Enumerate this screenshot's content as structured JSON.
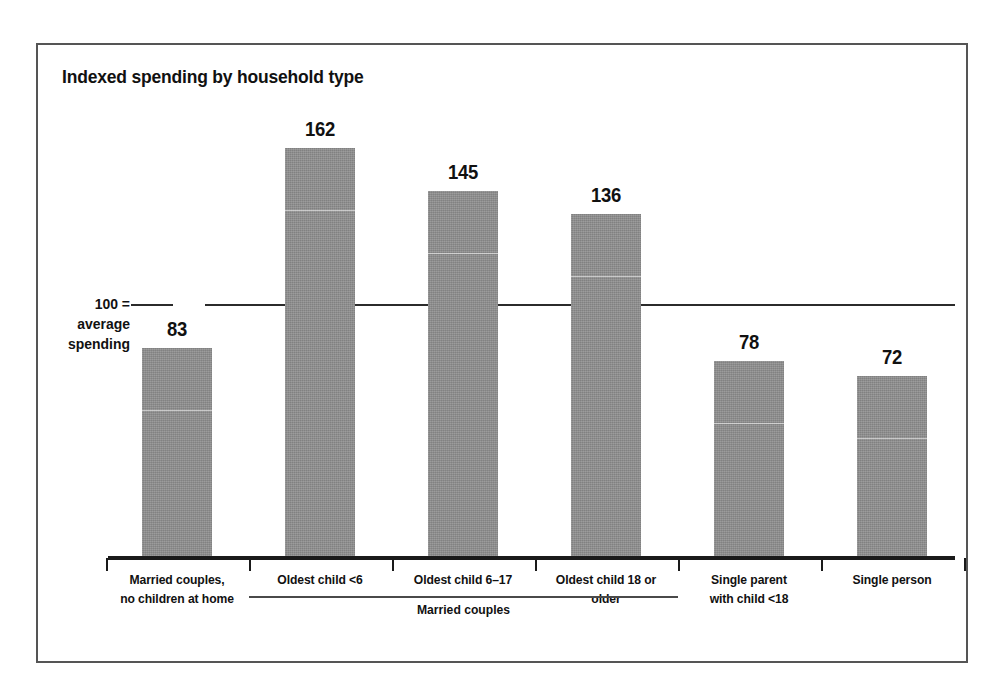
{
  "chart_data": {
    "type": "bar",
    "title": "Indexed spending by household type",
    "xlabel": "",
    "ylabel": "",
    "ylim": [
      0,
      170
    ],
    "grid": false,
    "legend": "none",
    "reference_line": {
      "value": 100,
      "label_lines": [
        "100 =",
        "average",
        "spending"
      ]
    },
    "categories": [
      "Married couples, no children at home",
      "Oldest child <6",
      "Oldest child 6–17",
      "Oldest child 18 or older",
      "Single parent with child <18",
      "Single person"
    ],
    "category_label_lines": [
      [
        "Married couples,",
        "no children at home"
      ],
      [
        "Oldest child <6"
      ],
      [
        "Oldest child 6–17"
      ],
      [
        "Oldest child 18 or",
        "older"
      ],
      [
        "Single parent",
        "with child <18"
      ],
      [
        "Single person"
      ]
    ],
    "values": [
      83,
      162,
      145,
      136,
      78,
      72
    ],
    "value_labels": [
      "83",
      "162",
      "145",
      "136",
      "78",
      "72"
    ],
    "group_bracket": {
      "label": "Married couples",
      "covers": [
        1,
        2,
        3
      ]
    },
    "colors": {
      "bar_fill": "#8e8e8e",
      "axis": "#1a1a1a",
      "reference_line": "#2b2b2b",
      "text": "#111111",
      "frame": "#555555",
      "background": "#ffffff"
    }
  }
}
